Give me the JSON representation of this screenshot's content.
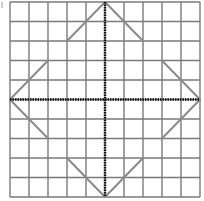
{
  "diagram": {
    "type": "grid-figure",
    "grid": {
      "columns": 10,
      "rows": 10,
      "left": 10,
      "top": 2,
      "width": 190,
      "height": 195,
      "line_color": "#7a7a7a"
    },
    "axes": {
      "x_axis_y": 99.5,
      "y_axis_x": 105,
      "style": "dotted",
      "color": "#111111"
    },
    "figure": {
      "color": "#8a8a8a",
      "description": "Stepped diamond outline made of diagonal segments, symmetric about both axes",
      "segments": [
        {
          "from": [
            0,
            5
          ],
          "to": [
            2,
            3
          ]
        },
        {
          "from": [
            3,
            2
          ],
          "to": [
            5,
            0
          ]
        },
        {
          "from": [
            5,
            0
          ],
          "to": [
            7,
            2
          ]
        },
        {
          "from": [
            8,
            3
          ],
          "to": [
            10,
            5
          ]
        },
        {
          "from": [
            10,
            5
          ],
          "to": [
            8,
            7
          ]
        },
        {
          "from": [
            7,
            8
          ],
          "to": [
            5,
            10
          ]
        },
        {
          "from": [
            5,
            10
          ],
          "to": [
            3,
            8
          ]
        },
        {
          "from": [
            2,
            7
          ],
          "to": [
            0,
            5
          ]
        }
      ]
    }
  }
}
